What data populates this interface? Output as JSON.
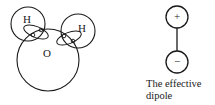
{
  "figure": {
    "background_color": "#ffffff",
    "ink_color": "#1a1a1a",
    "molecule": {
      "name": "water-molecule-diagram",
      "oxygen": {
        "label": "O",
        "cx": 48,
        "cy": 60,
        "r": 31
      },
      "hydrogens": [
        {
          "label": "H",
          "cx": 28,
          "cy": 24,
          "r": 17,
          "label_x": 27,
          "label_y": 20
        },
        {
          "label": "H",
          "cx": 78,
          "cy": 31,
          "r": 17,
          "label_x": 82,
          "label_y": 29
        }
      ],
      "lone_pairs": [
        {
          "name": "bonding-pair-left",
          "cx": 36,
          "cy": 32,
          "rx": 13,
          "ry": 5.5,
          "rotation": 22,
          "electrons": [
            {
              "cx": 41,
              "cy": 30,
              "r": 1.8
            },
            {
              "cx": 33,
              "cy": 35,
              "r": 1.8
            }
          ]
        },
        {
          "name": "bonding-pair-right",
          "cx": 69,
          "cy": 38,
          "rx": 13,
          "ry": 5.5,
          "rotation": -22,
          "electrons": [
            {
              "cx": 64,
              "cy": 36,
              "r": 1.8
            },
            {
              "cx": 73,
              "cy": 41,
              "r": 1.8
            }
          ]
        }
      ]
    },
    "dipole": {
      "name": "effective-dipole-diagram",
      "positive": {
        "symbol": "+",
        "cx": 177,
        "cy": 17,
        "r": 11
      },
      "negative": {
        "symbol": "−",
        "cx": 177,
        "cy": 62,
        "r": 11
      },
      "rod": {
        "x": 177,
        "y1": 28,
        "y2": 51
      },
      "caption": {
        "line1": "The effective",
        "line2": "dipole"
      }
    }
  }
}
